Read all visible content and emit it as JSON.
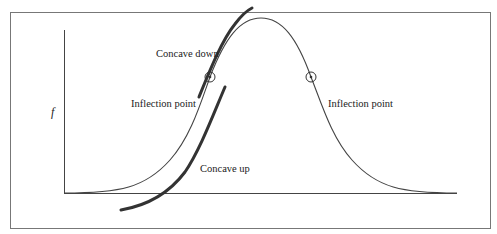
{
  "diagram": {
    "type": "bell-curve-inflection",
    "y_axis_label": "f",
    "labels": {
      "concave_down": "Concave down",
      "concave_up": "Concave up",
      "inflection_left": "Inflection point",
      "inflection_right": "Inflection point"
    },
    "colors": {
      "frame": "#777777",
      "axes": "#444444",
      "curve": "#444444",
      "tangent_arcs": "#333333",
      "text": "#222222"
    }
  }
}
